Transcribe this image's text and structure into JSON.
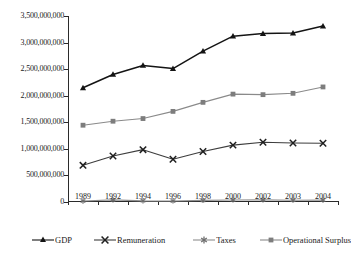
{
  "chart_data": {
    "type": "line",
    "title": "",
    "xlabel": "",
    "ylabel": "",
    "categories": [
      "1989",
      "1992",
      "1994",
      "1996",
      "1998",
      "2000",
      "2002",
      "2003",
      "2004"
    ],
    "ylim": [
      0,
      3500000000
    ],
    "ytick_values": [
      0,
      500000000,
      1000000000,
      1500000000,
      2000000000,
      2500000000,
      3000000000,
      3500000000
    ],
    "ytick_labels": [
      "0",
      "500,000,000",
      "1,000,000,000",
      "1,500,000,000",
      "2,000,000,000",
      "2,500,000,000",
      "3,000,000,000",
      "3,500,000,000"
    ],
    "grid": false,
    "legend_position": "bottom",
    "series": [
      {
        "name": "GDP",
        "marker": "triangle",
        "color": "#141414",
        "values": [
          2150000000,
          2400000000,
          2570000000,
          2510000000,
          2840000000,
          3120000000,
          3170000000,
          3180000000,
          3310000000
        ]
      },
      {
        "name": "Remuneration",
        "marker": "x",
        "color": "#3d3d3d",
        "values": [
          690000000,
          865000000,
          985000000,
          805000000,
          950000000,
          1070000000,
          1125000000,
          1110000000,
          1105000000
        ]
      },
      {
        "name": "Taxes",
        "marker": "asterisk",
        "color": "#8f8f8f",
        "values": [
          18000000,
          40000000,
          22000000,
          20000000,
          30000000,
          38000000,
          40000000,
          34000000,
          36000000
        ]
      },
      {
        "name": "Operational Surplus",
        "marker": "square",
        "color": "#8a8a8a",
        "values": [
          1445000000,
          1520000000,
          1570000000,
          1705000000,
          1875000000,
          2030000000,
          2020000000,
          2045000000,
          2165000000
        ]
      }
    ]
  },
  "legend": {
    "items": [
      {
        "label": "GDP"
      },
      {
        "label": "Remuneration"
      },
      {
        "label": "Taxes"
      },
      {
        "label": "Operational Surplus"
      }
    ]
  }
}
